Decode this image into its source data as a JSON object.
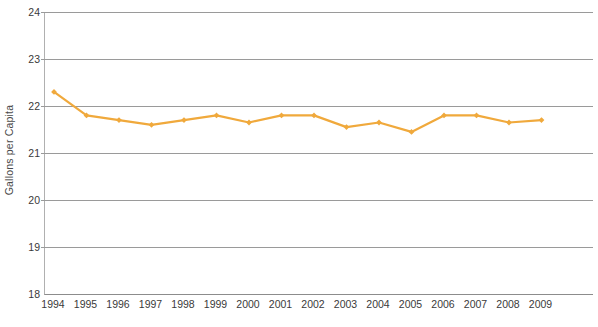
{
  "chart_data": {
    "type": "line",
    "title": "",
    "subtitle": "",
    "xlabel": "",
    "ylabel": "Gallons per Capita",
    "categories": [
      "1994",
      "1995",
      "1996",
      "1997",
      "1998",
      "1999",
      "2000",
      "2001",
      "2002",
      "2003",
      "2004",
      "2005",
      "2006",
      "2007",
      "2008",
      "2009"
    ],
    "values": [
      22.3,
      21.8,
      21.7,
      21.6,
      21.7,
      21.8,
      21.65,
      21.8,
      21.8,
      21.55,
      21.65,
      21.45,
      21.8,
      21.8,
      21.65,
      21.7
    ],
    "series": [
      {
        "name": "Gallons per Capita",
        "values": [
          22.3,
          21.8,
          21.7,
          21.6,
          21.7,
          21.8,
          21.65,
          21.8,
          21.8,
          21.55,
          21.65,
          21.45,
          21.8,
          21.8,
          21.65,
          21.7
        ]
      }
    ],
    "ylim": [
      18,
      24
    ],
    "yticks": [
      18,
      19,
      20,
      21,
      22,
      23,
      24
    ],
    "ytick_labels": [
      "18",
      "19",
      "20",
      "21",
      "22",
      "23",
      "24"
    ],
    "xtick_labels": [
      "1994",
      "1995",
      "1996",
      "1997",
      "1998",
      "1999",
      "2000",
      "2001",
      "2002",
      "2003",
      "2004",
      "2005",
      "2006",
      "2007",
      "2008",
      "2009"
    ],
    "grid": true,
    "grid_axis": "y",
    "legend": false,
    "legend_position": "none",
    "annotations": [],
    "colors": {
      "line": "#F0A93C",
      "marker": "#F0A93C",
      "grid": "#9a9a9a",
      "axis": "#8c8c8c",
      "text": "#3a3a3a",
      "background": "#ffffff"
    }
  }
}
